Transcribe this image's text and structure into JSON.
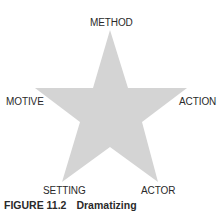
{
  "diagram": {
    "shape": "five-point-star",
    "fill_color": "#d4d4d4",
    "labels": {
      "top": "METHOD",
      "left": "MOTIVE",
      "right": "ACTION",
      "bottom_left": "SETTING",
      "bottom_right": "ACTOR"
    }
  },
  "caption": {
    "figure_number": "FIGURE 11.2",
    "title": "Dramatizing"
  }
}
